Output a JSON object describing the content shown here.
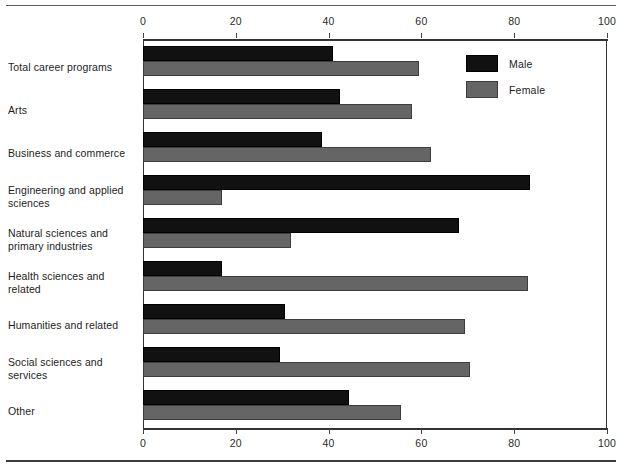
{
  "chart_data": {
    "type": "bar",
    "orientation": "horizontal",
    "title": "",
    "subtitle": "",
    "xlabel": "",
    "ylabel": "",
    "xlim": [
      0,
      100
    ],
    "xticks": [
      0,
      20,
      40,
      60,
      80,
      100
    ],
    "xtick_labels": [
      "0",
      "20",
      "40",
      "60",
      "80",
      "100"
    ],
    "grid": false,
    "axis_top": true,
    "axis_bottom": true,
    "legend_position": "top-right",
    "categories": [
      "Total career programs",
      "Arts",
      "Business and commerce",
      "Engineering and applied sciences",
      "Natural sciences and primary industries",
      "Health sciences and related",
      "Humanities and related",
      "Social sciences and services",
      "Other"
    ],
    "series": [
      {
        "name": "Male",
        "color": "#111111",
        "values": [
          41,
          42.5,
          38.5,
          83.5,
          68,
          17,
          30.5,
          29.5,
          44.5
        ]
      },
      {
        "name": "Female",
        "color": "#656565",
        "values": [
          59.5,
          58,
          62,
          17,
          32,
          83,
          69.5,
          70.5,
          55.5
        ]
      }
    ]
  },
  "legend": {
    "items": [
      {
        "label": "Male"
      },
      {
        "label": "Female"
      }
    ]
  }
}
